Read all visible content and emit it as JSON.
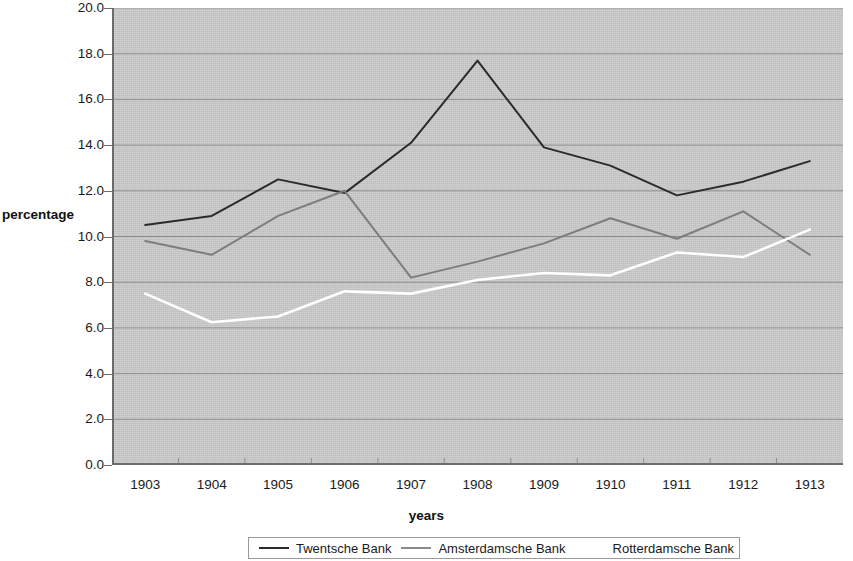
{
  "chart_data": {
    "type": "line",
    "title": "",
    "xlabel": "years",
    "ylabel": "percentage",
    "categories": [
      "1903",
      "1904",
      "1905",
      "1906",
      "1907",
      "1908",
      "1909",
      "1910",
      "1911",
      "1912",
      "1913"
    ],
    "ylim": [
      0.0,
      20.0
    ],
    "ytick_step": 2.0,
    "yticks": [
      "20.0",
      "18.0",
      "16.0",
      "14.0",
      "12.0",
      "10.0",
      "8.0",
      "6.0",
      "4.0",
      "2.0",
      "0.0"
    ],
    "ytick_values": [
      20.0,
      18.0,
      16.0,
      14.0,
      12.0,
      10.0,
      8.0,
      6.0,
      4.0,
      2.0,
      0.0
    ],
    "grid": true,
    "grid_axis": "y",
    "legend_position": "bottom",
    "plot_background": "#c9c9c9",
    "series": [
      {
        "name": "Twentsche Bank",
        "color": "#2b2b2b",
        "values": [
          10.5,
          10.9,
          12.5,
          11.9,
          14.1,
          17.7,
          13.9,
          13.1,
          11.8,
          12.4,
          13.3
        ]
      },
      {
        "name": "Amsterdamsche Bank",
        "color": "#7d7d7d",
        "values": [
          9.8,
          9.2,
          10.9,
          12.0,
          8.2,
          8.9,
          9.7,
          10.8,
          9.9,
          11.1,
          9.2
        ]
      },
      {
        "name": "Rotterdamsche Bank",
        "color": "#ffffff",
        "values": [
          7.5,
          6.25,
          6.5,
          7.6,
          7.5,
          8.1,
          8.4,
          8.3,
          9.3,
          9.1,
          10.3
        ]
      }
    ]
  },
  "legend": {
    "items": [
      {
        "label": "Twentsche Bank",
        "color": "#2b2b2b",
        "swatch": true
      },
      {
        "label": "Amsterdamsche Bank",
        "color": "#8a8a8a",
        "swatch": true
      },
      {
        "label": "Rotterdamsche Bank",
        "color": "#ffffff",
        "swatch": true
      }
    ]
  }
}
